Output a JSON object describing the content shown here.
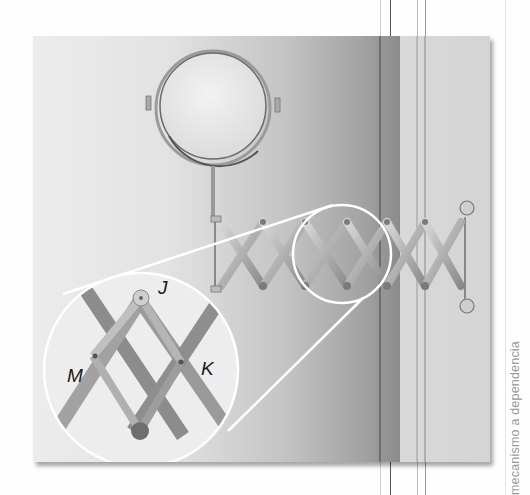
{
  "figure": {
    "inset_labels": {
      "top": "J",
      "left": "M",
      "right": "K",
      "bottom": "L"
    },
    "colors": {
      "page": "#ffffff",
      "photo_light": "#e6e6e6",
      "photo_dark": "#8c8c8c",
      "photo_strip": "#d6d6d6",
      "highlight": "#ffffff",
      "label": "#1a1a1a"
    }
  },
  "side_caption": {
    "text": "mecanismo a depen­dencia"
  }
}
